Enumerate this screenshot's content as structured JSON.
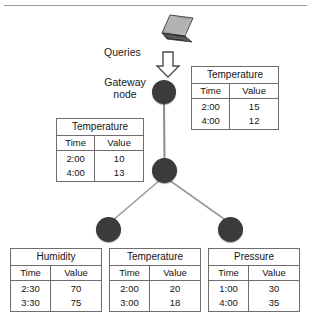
{
  "diagram": {
    "labels": {
      "queries": "Queries",
      "gateway_node": "Gateway node"
    },
    "icons": {
      "laptop": "laptop-icon",
      "query_arrow": "down-block-arrow-icon"
    },
    "colors": {
      "node_fill": "#3b3b3b",
      "edge_line": "#8c8c8c",
      "table_border": "#6e6e6e",
      "rule": "#9a9a9a",
      "text": "#141414"
    },
    "nodes": [
      {
        "id": "gateway",
        "label": "Gateway node"
      },
      {
        "id": "middle",
        "label": ""
      },
      {
        "id": "leaf-left",
        "label": ""
      },
      {
        "id": "leaf-right",
        "label": ""
      }
    ],
    "tables": {
      "gateway": {
        "title": "Temperature",
        "headers": [
          "Time",
          "Value"
        ],
        "rows": [
          [
            "2:00",
            "15"
          ],
          [
            "4:00",
            "12"
          ]
        ]
      },
      "middle": {
        "title": "Temperature",
        "headers": [
          "Time",
          "Value"
        ],
        "rows": [
          [
            "2:00",
            "10"
          ],
          [
            "4:00",
            "13"
          ]
        ]
      },
      "humidity": {
        "title": "Humidity",
        "headers": [
          "Time",
          "Value"
        ],
        "rows": [
          [
            "2:30",
            "70"
          ],
          [
            "3:30",
            "75"
          ]
        ]
      },
      "temperature": {
        "title": "Temperature",
        "headers": [
          "Time",
          "Value"
        ],
        "rows": [
          [
            "2:00",
            "20"
          ],
          [
            "3:00",
            "18"
          ]
        ]
      },
      "pressure": {
        "title": "Pressure",
        "headers": [
          "Time",
          "Value"
        ],
        "rows": [
          [
            "1:00",
            "30"
          ],
          [
            "4:00",
            "35"
          ]
        ]
      }
    }
  }
}
